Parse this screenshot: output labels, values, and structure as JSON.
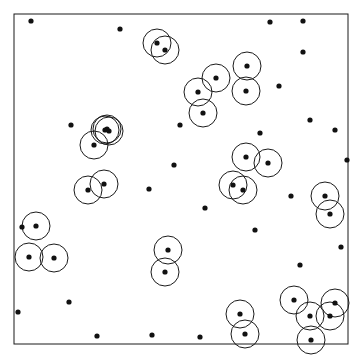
{
  "figure": {
    "title": "",
    "background_color": "#ffffff",
    "frame": {
      "x": 14,
      "y": 14,
      "width": 334,
      "height": 330,
      "stroke_color": "#1a1a1a",
      "stroke_width": 1,
      "fill": "none"
    },
    "point_style": {
      "radius": 2.6,
      "fill_color": "#111111",
      "stroke": "none"
    },
    "circle_style": {
      "radius": 14,
      "stroke_color": "#1a1a1a",
      "stroke_width": 1,
      "fill": "none"
    }
  },
  "chart_data": {
    "type": "scatter",
    "title": "",
    "xlabel": "",
    "ylabel": "",
    "xlim": [
      0,
      334
    ],
    "ylim": [
      0,
      330
    ],
    "grid": false,
    "legend": null,
    "counts": {
      "total_points": 56,
      "circled_points": 31,
      "plain_points": 25,
      "circles": 31
    },
    "series": [
      {
        "name": "circled-points",
        "marker": "filled-dot-with-circle",
        "points": [
          {
            "x": 157,
            "y": 43
          },
          {
            "x": 165,
            "y": 50
          },
          {
            "x": 216,
            "y": 78
          },
          {
            "x": 198,
            "y": 92
          },
          {
            "x": 203,
            "y": 113
          },
          {
            "x": 247,
            "y": 66
          },
          {
            "x": 246,
            "y": 91
          },
          {
            "x": 105,
            "y": 130
          },
          {
            "x": 94,
            "y": 145
          },
          {
            "x": 104,
            "y": 184
          },
          {
            "x": 88,
            "y": 190
          },
          {
            "x": 246,
            "y": 157
          },
          {
            "x": 268,
            "y": 163
          },
          {
            "x": 233,
            "y": 185
          },
          {
            "x": 243,
            "y": 190
          },
          {
            "x": 325,
            "y": 196
          },
          {
            "x": 330,
            "y": 214
          },
          {
            "x": 36,
            "y": 226
          },
          {
            "x": 29,
            "y": 257
          },
          {
            "x": 54,
            "y": 258
          },
          {
            "x": 168,
            "y": 250
          },
          {
            "x": 165,
            "y": 272
          },
          {
            "x": 240,
            "y": 314
          },
          {
            "x": 245,
            "y": 334
          },
          {
            "x": 294,
            "y": 300
          },
          {
            "x": 335,
            "y": 303
          },
          {
            "x": 310,
            "y": 316
          },
          {
            "x": 330,
            "y": 316
          },
          {
            "x": 311,
            "y": 340
          },
          {
            "x": 107,
            "y": 129
          },
          {
            "x": 109,
            "y": 131
          }
        ]
      },
      {
        "name": "plain-points",
        "marker": "filled-dot",
        "points": [
          {
            "x": 31,
            "y": 21
          },
          {
            "x": 120,
            "y": 29
          },
          {
            "x": 270,
            "y": 22
          },
          {
            "x": 303,
            "y": 21
          },
          {
            "x": 303,
            "y": 52
          },
          {
            "x": 279,
            "y": 86
          },
          {
            "x": 71,
            "y": 125
          },
          {
            "x": 335,
            "y": 130
          },
          {
            "x": 174,
            "y": 165
          },
          {
            "x": 149,
            "y": 189
          },
          {
            "x": 205,
            "y": 208
          },
          {
            "x": 291,
            "y": 196
          },
          {
            "x": 341,
            "y": 247
          },
          {
            "x": 255,
            "y": 230
          },
          {
            "x": 300,
            "y": 265
          },
          {
            "x": 69,
            "y": 302
          },
          {
            "x": 97,
            "y": 336
          },
          {
            "x": 152,
            "y": 335
          },
          {
            "x": 200,
            "y": 337
          },
          {
            "x": 22,
            "y": 227
          },
          {
            "x": 180,
            "y": 125
          },
          {
            "x": 310,
            "y": 120
          },
          {
            "x": 260,
            "y": 133
          },
          {
            "x": 18,
            "y": 312
          },
          {
            "x": 347,
            "y": 160
          }
        ]
      }
    ]
  }
}
